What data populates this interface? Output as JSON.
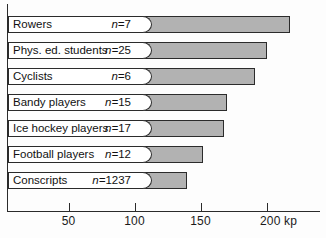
{
  "chart_data": {
    "type": "bar",
    "orientation": "horizontal",
    "title": "",
    "xlabel": "kp",
    "ylabel": "",
    "xlim": [
      0,
      240
    ],
    "grid": false,
    "legend": false,
    "unit_label": "kp",
    "categories": [
      "Rowers",
      "Phys. ed. students",
      "Cyclists",
      "Bandy players",
      "Ice hockey players",
      "Football players",
      "Conscripts"
    ],
    "values": [
      218,
      200,
      191,
      170,
      168,
      152,
      140
    ],
    "counts": [
      7,
      25,
      6,
      15,
      17,
      12,
      1237
    ],
    "count_prefix": "n=",
    "count_symbol": "n",
    "ticks": [
      {
        "value": 50,
        "label": "50"
      },
      {
        "value": 100,
        "label": "100"
      },
      {
        "value": 150,
        "label": "150"
      },
      {
        "value": 200,
        "label": "200 kp"
      }
    ],
    "rows": [
      {
        "label": "Rowers",
        "n_text": "n=7",
        "value": 218
      },
      {
        "label": "Phys. ed. students",
        "n_text": "n=25",
        "value": 200
      },
      {
        "label": "Cyclists",
        "n_text": "n=6",
        "value": 191
      },
      {
        "label": "Bandy players",
        "n_text": "n=15",
        "value": 170
      },
      {
        "label": "Ice hockey players",
        "n_text": "n=17",
        "value": 168
      },
      {
        "label": "Football players",
        "n_text": "n=12",
        "value": 152
      },
      {
        "label": "Conscripts",
        "n_text": "n=1237",
        "value": 140
      }
    ],
    "colors": {
      "bar_fill": "#b2b2b2",
      "bar_stroke": "#2b2b2b",
      "label_plate": "#ffffff",
      "axis": "#2b2b2b",
      "text": "#111111",
      "background": "#fdfdfd"
    }
  }
}
